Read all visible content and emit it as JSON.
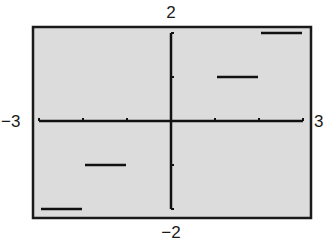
{
  "chart_data": {
    "type": "line",
    "title": "",
    "xlabel": "",
    "ylabel": "",
    "xlim": [
      -3,
      3
    ],
    "ylim": [
      -2,
      2
    ],
    "grid": false,
    "window_labels": {
      "xmin": "−3",
      "xmax": "3",
      "ymin": "−2",
      "ymax": "2"
    },
    "x_ticks": [
      -3,
      -2,
      -1,
      0,
      1,
      2,
      3
    ],
    "y_ticks": [
      -2,
      -1,
      0,
      1,
      2
    ],
    "series": [
      {
        "name": "step function",
        "segments": [
          {
            "x": [
              -3,
              -2
            ],
            "y": -2
          },
          {
            "x": [
              -2,
              -1
            ],
            "y": -1
          },
          {
            "x": [
              1,
              2
            ],
            "y": 1
          },
          {
            "x": [
              2,
              3
            ],
            "y": 2
          }
        ]
      }
    ]
  },
  "colors": {
    "screen_bg": "#dcdcdc",
    "frame": "#1a1a1a",
    "axis": "#111111",
    "plot": "#111111"
  },
  "layout": {
    "frame": {
      "x": 33,
      "y": 27,
      "w": 278,
      "h": 191
    },
    "origin_px": {
      "x": 171,
      "y": 121
    },
    "unit_px": {
      "x": 44,
      "y": 44
    }
  }
}
